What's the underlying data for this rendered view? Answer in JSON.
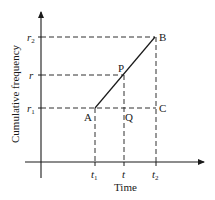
{
  "diagram": {
    "type": "cumulative-frequency-interpolation",
    "axes": {
      "x_label": "Time",
      "y_label": "Cumulative frequency",
      "x_ticks": [
        {
          "base": "t",
          "sub": "1"
        },
        {
          "base": "t",
          "sub": ""
        },
        {
          "base": "t",
          "sub": "2"
        }
      ],
      "y_ticks": [
        {
          "base": "r",
          "sub": "2"
        },
        {
          "base": "r",
          "sub": ""
        },
        {
          "base": "r",
          "sub": "1"
        }
      ]
    },
    "points": {
      "A": "A",
      "B": "B",
      "C": "C",
      "P": "P",
      "Q": "Q"
    },
    "colors": {
      "line": "#1a1a1a",
      "background": "#ffffff"
    }
  }
}
